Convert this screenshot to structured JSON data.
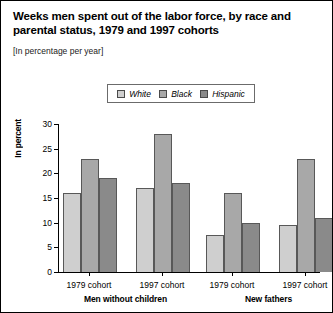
{
  "chart_data": {
    "type": "bar",
    "title": "Weeks men spent out of the labor force, by race and parental status, 1979 and 1997 cohorts",
    "subtitle": "[In percentage per year]",
    "xlabel": "",
    "ylabel": "In percent",
    "ylim": [
      0,
      30
    ],
    "ytick_labels": [
      "0",
      "5",
      "10",
      "15",
      "20",
      "25",
      "30"
    ],
    "ytick_values": [
      0,
      5,
      10,
      15,
      20,
      25,
      30
    ],
    "grid": false,
    "legend_position": "top-center",
    "categories": [
      "1979 cohort",
      "1997 cohort",
      "1979 cohort",
      "1997 cohort"
    ],
    "panels": [
      {
        "label": "Men without children",
        "categories": [
          "1979 cohort",
          "1997 cohort"
        ]
      },
      {
        "label": "New fathers",
        "categories": [
          "1979 cohort",
          "1997 cohort"
        ]
      }
    ],
    "series": [
      {
        "name": "White",
        "color": "#cfcfcf",
        "values": [
          16,
          17,
          7.5,
          9.5
        ]
      },
      {
        "name": "Black",
        "color": "#a8a8a8",
        "values": [
          23,
          28,
          16,
          23
        ]
      },
      {
        "name": "Hispanic",
        "color": "#8a8a8a",
        "values": [
          19,
          18,
          10,
          11
        ]
      }
    ]
  },
  "legend": {
    "items": [
      {
        "label": "White",
        "color": "#cfcfcf"
      },
      {
        "label": "Black",
        "color": "#a8a8a8"
      },
      {
        "label": "Hispanic",
        "color": "#8a8a8a"
      }
    ]
  },
  "colors": {
    "border": "#000000",
    "bar_outline": "#585858",
    "text": "#000000"
  }
}
